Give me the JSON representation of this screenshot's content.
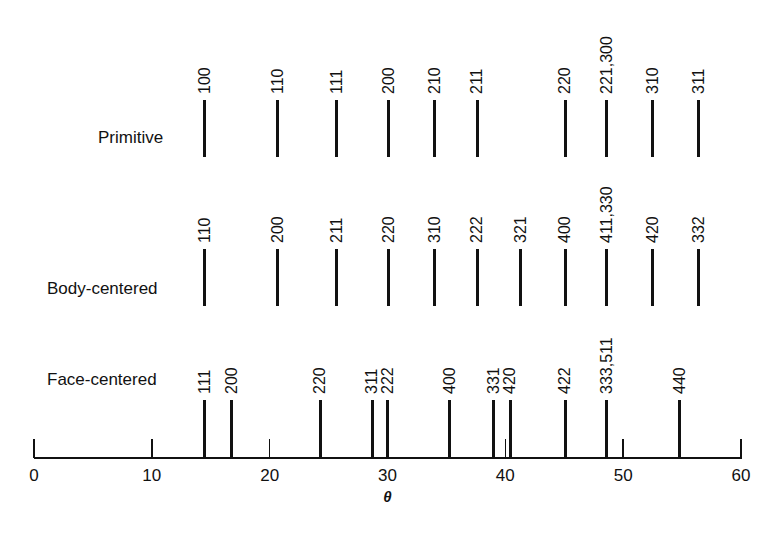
{
  "chart_data": {
    "type": "stick-pattern",
    "title": "",
    "xlabel": "θ",
    "ylabel": "",
    "xlim": [
      0,
      60
    ],
    "x_ticks": [
      0,
      10,
      20,
      30,
      40,
      50,
      60
    ],
    "grid": false,
    "series": [
      {
        "name": "Primitive",
        "lines": [
          {
            "hkl": "100",
            "theta": 14.5
          },
          {
            "hkl": "110",
            "theta": 20.7
          },
          {
            "hkl": "111",
            "theta": 25.7
          },
          {
            "hkl": "200",
            "theta": 30.1
          },
          {
            "hkl": "210",
            "theta": 34.0
          },
          {
            "hkl": "211",
            "theta": 37.6
          },
          {
            "hkl": "220",
            "theta": 45.1
          },
          {
            "hkl": "221,300",
            "theta": 48.6
          },
          {
            "hkl": "310",
            "theta": 52.5
          },
          {
            "hkl": "311",
            "theta": 56.4
          }
        ]
      },
      {
        "name": "Body-centered",
        "lines": [
          {
            "hkl": "110",
            "theta": 14.5
          },
          {
            "hkl": "200",
            "theta": 20.7
          },
          {
            "hkl": "211",
            "theta": 25.7
          },
          {
            "hkl": "220",
            "theta": 30.1
          },
          {
            "hkl": "310",
            "theta": 34.0
          },
          {
            "hkl": "222",
            "theta": 37.6
          },
          {
            "hkl": "321",
            "theta": 41.3
          },
          {
            "hkl": "400",
            "theta": 45.1
          },
          {
            "hkl": "411,330",
            "theta": 48.6
          },
          {
            "hkl": "420",
            "theta": 52.5
          },
          {
            "hkl": "332",
            "theta": 56.4
          }
        ]
      },
      {
        "name": "Face-centered",
        "lines": [
          {
            "hkl": "111",
            "theta": 14.5
          },
          {
            "hkl": "200",
            "theta": 16.8
          },
          {
            "hkl": "220",
            "theta": 24.3
          },
          {
            "hkl": "311",
            "theta": 28.7
          },
          {
            "hkl": "222",
            "theta": 30.0
          },
          {
            "hkl": "400",
            "theta": 35.3
          },
          {
            "hkl": "331",
            "theta": 39.0
          },
          {
            "hkl": "420",
            "theta": 40.4
          },
          {
            "hkl": "422",
            "theta": 45.1
          },
          {
            "hkl": "333,511",
            "theta": 48.6
          },
          {
            "hkl": "440",
            "theta": 54.8
          }
        ]
      }
    ]
  },
  "rows": [
    {
      "label": "Primitive",
      "label_x": 98,
      "label_y": 138,
      "line_top": 100,
      "line_bottom": 157,
      "text_bottom": 94
    },
    {
      "label": "Body-centered",
      "label_x": 47,
      "label_y": 289,
      "line_top": 249,
      "line_bottom": 306,
      "text_bottom": 243
    },
    {
      "label": "Face-centered",
      "label_x": 47,
      "label_y": 380,
      "line_top": 400,
      "line_bottom": 458,
      "text_bottom": 394
    }
  ],
  "axis": {
    "x0_px": 34,
    "x60_px": 741,
    "baseline_y": 458,
    "tick_top": 439,
    "xlabel": "θ"
  }
}
